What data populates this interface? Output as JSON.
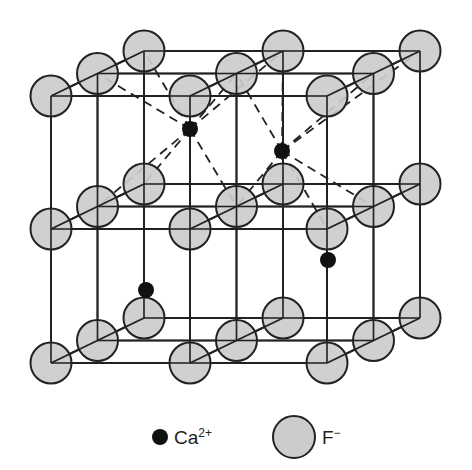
{
  "figure": {
    "colors": {
      "cation_fill": "#111111",
      "anion_fill": "#cccccc",
      "outline": "#222222",
      "background": "#ffffff"
    }
  },
  "legend": {
    "cation": {
      "symbol": "Ca",
      "charge": "2+",
      "label": "Ca2+",
      "icon": "filled-black-dot"
    },
    "anion": {
      "symbol": "F",
      "charge": "−",
      "label": "F−",
      "icon": "gray-circle"
    }
  },
  "lattice": {
    "anion_count_visible": 27,
    "cation_count_visible": 4
  }
}
